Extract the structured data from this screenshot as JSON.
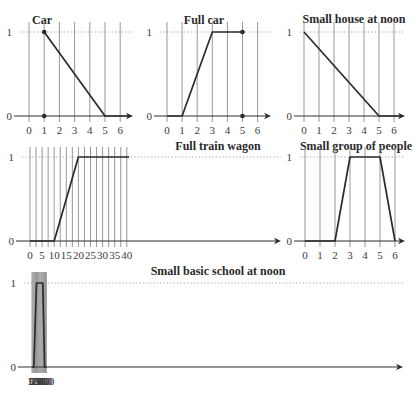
{
  "figure": {
    "background": "#ffffff",
    "line_color": "#2b2b2b",
    "grid_color": "#8c8c8c"
  },
  "chart_data": [
    {
      "id": "car",
      "type": "line",
      "title": "Car",
      "xlabel": "",
      "ylabel": "",
      "x_ticks": [
        0,
        1,
        2,
        3,
        4,
        5,
        6
      ],
      "x_tick_labels": [
        "0",
        "1",
        "2",
        "3",
        "4",
        "5",
        "6"
      ],
      "y_ticks": [
        0,
        1
      ],
      "y_tick_labels": [
        "0",
        "1"
      ],
      "xlim": [
        0,
        6
      ],
      "ylim": [
        0,
        1
      ],
      "grid": "vertical",
      "points": [
        [
          1,
          1
        ],
        [
          5,
          0
        ],
        [
          6.6,
          0
        ]
      ],
      "markers": [
        [
          1,
          1
        ],
        [
          1,
          0
        ]
      ],
      "layout": {
        "x0": 29,
        "x_step": 15.2,
        "y0": 116,
        "y1": 32,
        "arrow_end": 133,
        "axis_start": 14,
        "title_x": 42,
        "title_y": 24,
        "grid_top": 22,
        "dotted_end": 133
      }
    },
    {
      "id": "full-car",
      "type": "line",
      "title": "Full car",
      "xlabel": "",
      "ylabel": "",
      "x_ticks": [
        0,
        1,
        2,
        3,
        4,
        5,
        6
      ],
      "x_tick_labels": [
        "0",
        "1",
        "2",
        "3",
        "4",
        "5",
        "6"
      ],
      "y_ticks": [
        0,
        1
      ],
      "y_tick_labels": [
        "0",
        "1"
      ],
      "xlim": [
        0,
        6
      ],
      "ylim": [
        0,
        1
      ],
      "grid": "vertical",
      "points": [
        [
          0,
          0
        ],
        [
          1,
          0
        ],
        [
          3,
          1
        ],
        [
          5,
          1
        ]
      ],
      "markers": [
        [
          5,
          1
        ],
        [
          5,
          0
        ]
      ],
      "layout": {
        "x0": 167,
        "x_step": 15.1,
        "y0": 116,
        "y1": 32,
        "arrow_end": 271,
        "axis_start": 154,
        "title_x": 204,
        "title_y": 24,
        "grid_top": 22,
        "dotted_end": 271
      }
    },
    {
      "id": "small-house-at-noon",
      "type": "line",
      "title": "Small house at noon",
      "xlabel": "",
      "ylabel": "",
      "x_ticks": [
        0,
        1,
        2,
        3,
        4,
        5,
        6
      ],
      "x_tick_labels": [
        "0",
        "1",
        "2",
        "3",
        "4",
        "5",
        "6"
      ],
      "y_ticks": [
        0,
        1
      ],
      "y_tick_labels": [
        "0",
        "1"
      ],
      "xlim": [
        0,
        6
      ],
      "ylim": [
        0,
        1
      ],
      "grid": "vertical",
      "points": [
        [
          0,
          1
        ],
        [
          5,
          0
        ],
        [
          6.5,
          0
        ]
      ],
      "markers": [],
      "layout": {
        "x0": 304,
        "x_step": 15.0,
        "y0": 116,
        "y1": 32,
        "arrow_end": 405,
        "axis_start": 294,
        "title_x": 354,
        "title_y": 23,
        "grid_top": 22,
        "dotted_end": 405
      }
    },
    {
      "id": "full-train-wagon",
      "type": "line",
      "title": "Full train wagon",
      "xlabel": "",
      "ylabel": "",
      "x_ticks": [
        0,
        2.5,
        5,
        7.5,
        10,
        12.5,
        15,
        17.5,
        20,
        22.5,
        25,
        27.5,
        30,
        32.5,
        35,
        37.5,
        40
      ],
      "x_tick_labels": [
        "0",
        "",
        "5",
        "",
        "10",
        "",
        "15",
        "",
        "20",
        "",
        "25",
        "",
        "30",
        "",
        "35",
        "",
        "40"
      ],
      "y_ticks": [
        0,
        1
      ],
      "y_tick_labels": [
        "0",
        "1"
      ],
      "xlim": [
        0,
        40
      ],
      "ylim": [
        0,
        1
      ],
      "grid": "vertical",
      "points": [
        [
          0,
          0
        ],
        [
          10,
          0
        ],
        [
          20,
          1
        ],
        [
          41,
          1
        ]
      ],
      "markers": [],
      "layout": {
        "x0": 30,
        "x_step": 6.05,
        "y0": 241,
        "y1": 157,
        "arrow_end": 281,
        "axis_start": 16,
        "title_x": 218,
        "title_y": 150,
        "grid_top": 147,
        "dotted_end": 281
      }
    },
    {
      "id": "small-group-of-people",
      "type": "line",
      "title": "Small group of people",
      "xlabel": "",
      "ylabel": "",
      "x_ticks": [
        0,
        1,
        2,
        3,
        4,
        5,
        6
      ],
      "x_tick_labels": [
        "0",
        "1",
        "2",
        "3",
        "4",
        "5",
        "6"
      ],
      "y_ticks": [
        0,
        1
      ],
      "y_tick_labels": [
        "0",
        "1"
      ],
      "xlim": [
        0,
        6
      ],
      "ylim": [
        0,
        1
      ],
      "grid": "vertical",
      "points": [
        [
          0,
          0
        ],
        [
          2,
          0
        ],
        [
          3,
          1
        ],
        [
          5,
          1
        ],
        [
          6,
          0
        ]
      ],
      "markers": [],
      "layout": {
        "x0": 305,
        "x_step": 15.0,
        "y0": 241,
        "y1": 157,
        "arrow_end": 405,
        "axis_start": 294,
        "title_x": 356,
        "title_y": 150,
        "grid_top": 147,
        "dotted_end": 405
      }
    },
    {
      "id": "small-basic-school-at-noon",
      "type": "line",
      "title": "Small basic school at noon",
      "xlabel": "",
      "ylabel": "",
      "x_ticks": [
        0,
        25,
        50,
        75,
        100,
        125,
        150,
        175,
        200,
        225,
        250,
        275,
        300,
        325,
        350,
        375,
        400
      ],
      "x_tick_labels": [
        "0",
        "",
        "50",
        "",
        "100",
        "",
        "150",
        "",
        "200",
        "",
        "250",
        "",
        "300",
        "",
        "350",
        "",
        "400"
      ],
      "y_ticks": [
        0,
        1
      ],
      "y_tick_labels": [
        "0",
        "1"
      ],
      "xlim": [
        0,
        400
      ],
      "ylim": [
        0,
        1
      ],
      "grid": "vertical",
      "points": [
        [
          0,
          0
        ],
        [
          50,
          0
        ],
        [
          125,
          1
        ],
        [
          300,
          1
        ],
        [
          350,
          0
        ],
        [
          402,
          0
        ]
      ],
      "markers": [],
      "layout": {
        "x0": 32,
        "x_step": 0.8975,
        "y0": 367,
        "y1": 283,
        "arrow_end": 403,
        "axis_start": 18,
        "title_x": 218,
        "title_y": 275,
        "grid_top": 272,
        "dotted_end": 403
      }
    }
  ]
}
